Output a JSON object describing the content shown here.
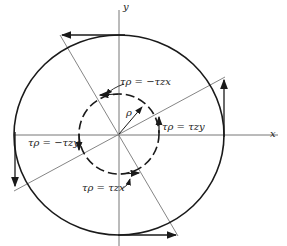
{
  "axes": {
    "x_label": "x",
    "y_label": "y"
  },
  "labels": {
    "top": "τρ = −τzx",
    "right": "τρ = τzy",
    "left": "τρ = −τzy",
    "bottom": "τρ = τzx",
    "radius": "ρ"
  },
  "colors": {
    "line": "#1a1a1a",
    "thin": "#666666",
    "background": "#ffffff"
  }
}
